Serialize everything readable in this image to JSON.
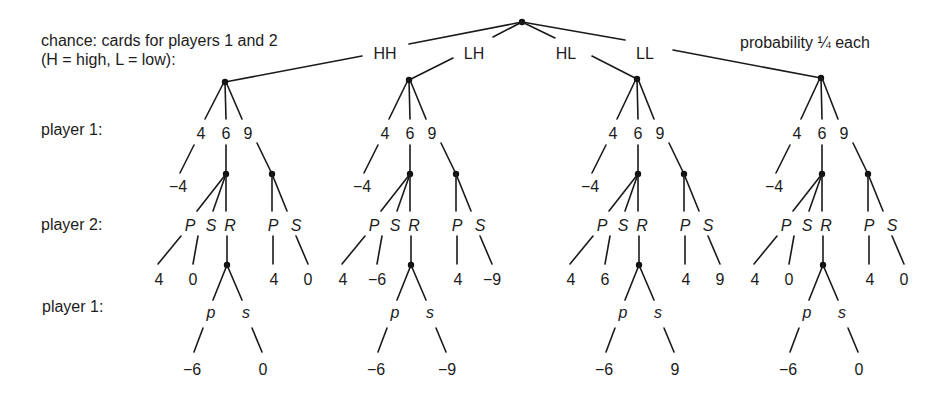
{
  "figure": {
    "chance_label_line1": "chance: cards for players 1 and 2",
    "chance_label_line2": "(H = high, L = low):",
    "probability_label": "probability ¼ each",
    "row_labels": {
      "player1_top": "player 1:",
      "player2": "player 2:",
      "player1_bottom": "player 1:"
    },
    "colors": {
      "ink": "#1c1c1c",
      "background": "#ffffff"
    }
  },
  "subtrees": [
    {
      "deal": "HH",
      "player1_moves": [
        "4",
        "6",
        "9"
      ],
      "payoff_fold_4": "−4",
      "after_6_moves": [
        "P",
        "S",
        "R"
      ],
      "after_9_moves": [
        "P",
        "S"
      ],
      "after_6_payoffs": [
        "4",
        "0"
      ],
      "after_9_payoffs": [
        "4",
        "0"
      ],
      "after_R_moves": [
        "p",
        "s"
      ],
      "after_R_payoffs": [
        "−6",
        "0"
      ]
    },
    {
      "deal": "LH",
      "player1_moves": [
        "4",
        "6",
        "9"
      ],
      "payoff_fold_4": "−4",
      "after_6_moves": [
        "P",
        "S",
        "R"
      ],
      "after_9_moves": [
        "P",
        "S"
      ],
      "after_6_payoffs": [
        "4",
        "−6"
      ],
      "after_9_payoffs": [
        "4",
        "−9"
      ],
      "after_R_moves": [
        "p",
        "s"
      ],
      "after_R_payoffs": [
        "−6",
        "−9"
      ]
    },
    {
      "deal": "HL",
      "player1_moves": [
        "4",
        "6",
        "9"
      ],
      "payoff_fold_4": "−4",
      "after_6_moves": [
        "P",
        "S",
        "R"
      ],
      "after_9_moves": [
        "P",
        "S"
      ],
      "after_6_payoffs": [
        "4",
        "6"
      ],
      "after_9_payoffs": [
        "4",
        "9"
      ],
      "after_R_moves": [
        "p",
        "s"
      ],
      "after_R_payoffs": [
        "−6",
        "9"
      ]
    },
    {
      "deal": "LL",
      "player1_moves": [
        "4",
        "6",
        "9"
      ],
      "payoff_fold_4": "−4",
      "after_6_moves": [
        "P",
        "S",
        "R"
      ],
      "after_9_moves": [
        "P",
        "S"
      ],
      "after_6_payoffs": [
        "4",
        "0"
      ],
      "after_9_payoffs": [
        "4",
        "0"
      ],
      "after_R_moves": [
        "p",
        "s"
      ],
      "after_R_payoffs": [
        "−6",
        "0"
      ]
    }
  ]
}
